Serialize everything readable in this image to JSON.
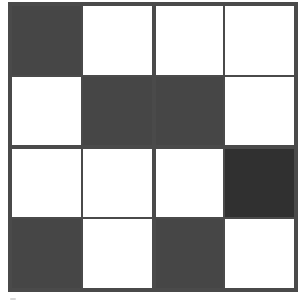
{
  "grid": {
    "rows": 4,
    "cols": 4,
    "cells": [
      [
        "dark",
        "light",
        "light",
        "light"
      ],
      [
        "light",
        "dark",
        "dark",
        "light"
      ],
      [
        "light",
        "light",
        "light",
        "darker"
      ],
      [
        "dark",
        "light",
        "dark",
        "light"
      ]
    ],
    "colors": {
      "light": "#ffffff",
      "dark": "#464646",
      "darker": "#303030",
      "border": "#4a4a4a"
    }
  }
}
